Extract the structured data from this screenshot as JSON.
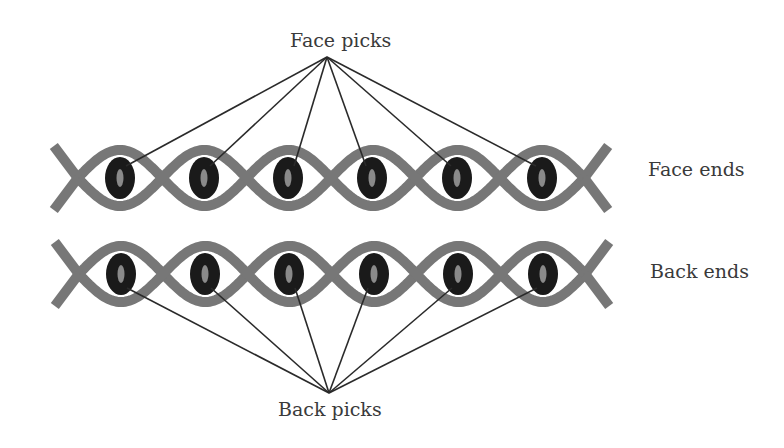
{
  "labels": {
    "face_picks": "Face picks",
    "back_picks": "Back picks",
    "face_ends": "Face ends",
    "back_ends": "Back ends"
  },
  "colors": {
    "strand": "#777777",
    "pick_outer": "#1a1a1a",
    "pick_inner": "#8a8a8a",
    "leader_line": "#2a2a2a",
    "text": "#3a3a3a",
    "background": "#ffffff"
  },
  "rows": [
    {
      "name": "face-ends",
      "center_y": 178,
      "pick_count": 6,
      "pick_centers_x": [
        120,
        204,
        288,
        372,
        457,
        542
      ],
      "leader_target": {
        "x": 327,
        "y": 57
      },
      "leader_attach": "top"
    },
    {
      "name": "back-ends",
      "center_y": 274,
      "pick_count": 6,
      "pick_centers_x": [
        121,
        205,
        289,
        374,
        458,
        543
      ],
      "leader_target": {
        "x": 329,
        "y": 393
      },
      "leader_attach": "bottom"
    }
  ]
}
